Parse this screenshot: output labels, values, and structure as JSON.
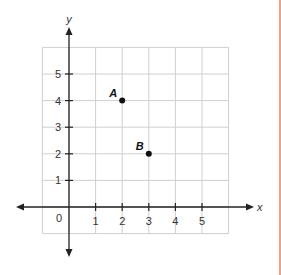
{
  "chart_data": {
    "type": "scatter",
    "title": "",
    "xlabel": "x",
    "ylabel": "y",
    "xlim": [
      -1,
      6
    ],
    "ylim": [
      -1,
      6
    ],
    "grid": true,
    "x_ticks": [
      "1",
      "2",
      "3",
      "4",
      "5"
    ],
    "y_ticks": [
      "1",
      "2",
      "3",
      "4",
      "5"
    ],
    "origin_label": "0",
    "points": [
      {
        "label": "A",
        "x": 2,
        "y": 4
      },
      {
        "label": "B",
        "x": 3,
        "y": 2
      }
    ]
  },
  "colors": {
    "grid": "#cfcfcf",
    "axis": "#222222",
    "point": "#111111",
    "border": "#e9a487"
  }
}
